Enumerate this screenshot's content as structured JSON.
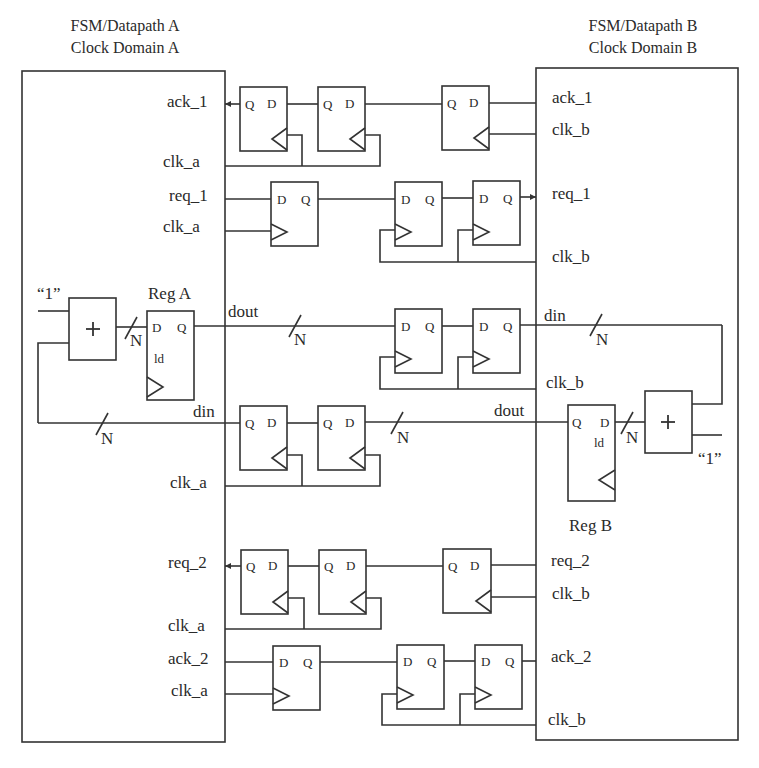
{
  "domain_a": {
    "title_line1": "FSM/Datapath A",
    "title_line2": "Clock Domain A",
    "ports": {
      "ack_1": "ack_1",
      "clk_a_1": "clk_a",
      "req_1": "req_1",
      "clk_a_2": "clk_a",
      "dout": "dout",
      "din": "din",
      "clk_a_3": "clk_a",
      "req_2": "req_2",
      "clk_a_4": "clk_a",
      "ack_2": "ack_2",
      "clk_a_5": "clk_a"
    },
    "register": {
      "name": "Reg A",
      "d": "D",
      "q": "Q",
      "ld": "ld"
    },
    "adder": {
      "symbol": "+",
      "constant": "“1”"
    },
    "bus_width": "N"
  },
  "domain_b": {
    "title_line1": "FSM/Datapath B",
    "title_line2": "Clock Domain B",
    "ports": {
      "ack_1": "ack_1",
      "clk_b_1": "clk_b",
      "req_1": "req_1",
      "clk_b_2": "clk_b",
      "din": "din",
      "clk_b_3": "clk_b",
      "dout": "dout",
      "req_2": "req_2",
      "clk_b_4": "clk_b",
      "ack_2": "ack_2",
      "clk_b_5": "clk_b"
    },
    "register": {
      "name": "Reg B",
      "d": "D",
      "q": "Q",
      "ld": "ld"
    },
    "adder": {
      "symbol": "+",
      "constant": "“1”"
    },
    "bus_width": "N"
  },
  "flipflop": {
    "d": "D",
    "q": "Q"
  },
  "bus_labels": {
    "dout_bus": "N",
    "din_bus": "N",
    "feedback_a": "N",
    "regb_in": "N",
    "din_b": "N"
  }
}
